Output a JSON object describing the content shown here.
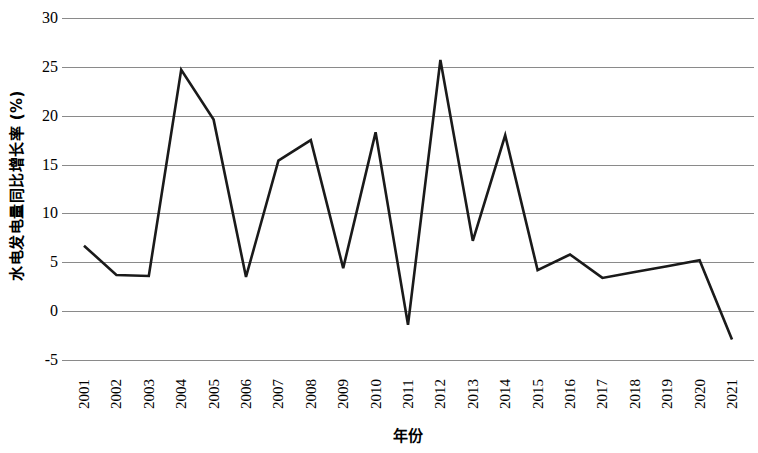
{
  "chart_data": {
    "type": "line",
    "title": "",
    "xlabel": "年份",
    "ylabel": "水电发电量同比增长率 (%)",
    "categories": [
      "2001",
      "2002",
      "2003",
      "2004",
      "2005",
      "2006",
      "2007",
      "2008",
      "2009",
      "2010",
      "2011",
      "2012",
      "2013",
      "2014",
      "2015",
      "2016",
      "2017",
      "2018",
      "2019",
      "2020",
      "2021"
    ],
    "values": [
      6.7,
      3.7,
      3.6,
      24.7,
      19.6,
      3.5,
      15.4,
      17.5,
      4.4,
      18.3,
      -1.4,
      25.7,
      7.2,
      18.0,
      4.2,
      5.8,
      3.4,
      4.0,
      4.6,
      5.2,
      -2.9
    ],
    "series": [
      {
        "name": "水电发电量同比增长率",
        "values": [
          6.7,
          3.7,
          3.6,
          24.7,
          19.6,
          3.5,
          15.4,
          17.5,
          4.4,
          18.3,
          -1.4,
          25.7,
          7.2,
          18.0,
          4.2,
          5.8,
          3.4,
          4.0,
          4.6,
          5.2,
          -2.9
        ]
      }
    ],
    "ylim": [
      -5,
      30
    ],
    "yticks": [
      -5,
      0,
      5,
      10,
      15,
      20,
      25,
      30
    ],
    "ytick_labels": [
      "-5",
      "0",
      "5",
      "10",
      "15",
      "20",
      "25",
      "30"
    ],
    "grid": "horizontal",
    "legend": "none",
    "line_color": "#1a1a1a",
    "grid_color": "#8a8a8a",
    "background_color": "#ffffff"
  }
}
